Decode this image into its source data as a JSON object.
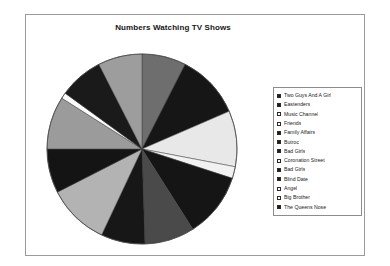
{
  "chart": {
    "title": "Numbers Watching TV Shows",
    "frame_border_color": "#9a9a9a",
    "legend_border_color": "#8d8d8d"
  },
  "chart_data": {
    "type": "pie",
    "title": "Numbers Watching TV Shows",
    "xlabel": "",
    "ylabel": "",
    "legend_position": "right",
    "grid": false,
    "start_angle_deg": 0,
    "direction": "clockwise",
    "categories": [
      "Two Guys And A Girl",
      "Eastenders",
      "Music Channel",
      "Friends",
      "Family Affairs",
      "Butroc",
      "Bad Girls",
      "Coronation Street",
      "Bad Girls",
      "Blind Date",
      "Angel",
      "Big Brother",
      "The Queens Nose"
    ],
    "values": [
      7.5,
      11.0,
      9.5,
      2.0,
      11.0,
      8.5,
      7.5,
      10.5,
      7.5,
      9.0,
      1.0,
      7.5,
      7.5
    ],
    "slice_colors": [
      "#6e6e6e",
      "#161616",
      "#e8e8e8",
      "#f2f2f2",
      "#151515",
      "#4a4a4a",
      "#171717",
      "#b3b3b3",
      "#141414",
      "#9b9b9b",
      "#fbfbfb",
      "#1a1a1a",
      "#9d9d9d"
    ],
    "legend_swatches": [
      "filled",
      "filled",
      "hollow",
      "hollow",
      "filled",
      "filled",
      "filled",
      "hollow",
      "filled",
      "filled",
      "hollow",
      "hollow",
      "filled"
    ]
  }
}
